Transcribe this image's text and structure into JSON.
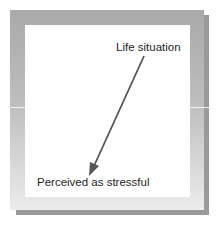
{
  "diagram": {
    "start_label": "Life situation",
    "end_label": "Perceived as stressful",
    "arrow": {
      "from": "Life situation",
      "to": "Perceived as stressful",
      "color": "#555555"
    },
    "colors": {
      "frame": "#b5b5b5",
      "shadow": "#9a9a9a",
      "panel": "#ffffff",
      "text": "#1e1e1e"
    }
  }
}
